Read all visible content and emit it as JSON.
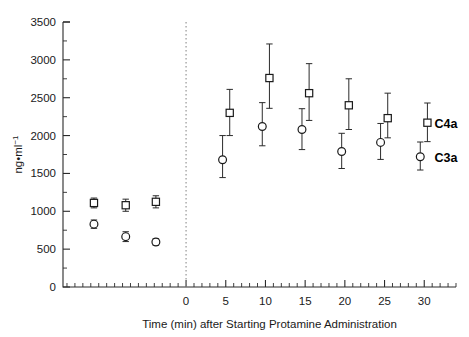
{
  "chart_data": {
    "type": "scatter",
    "title": "",
    "xlabel": "Time (min) after Starting Protamine Administration",
    "ylabel": "ng•ml⁻¹",
    "ylim": [
      0,
      3500
    ],
    "ytick_values": [
      0,
      500,
      1000,
      1500,
      2000,
      2500,
      3000,
      3500
    ],
    "ytick_labels": [
      "0",
      "500",
      "1000",
      "1500",
      "2000",
      "2500",
      "3000",
      "3500"
    ],
    "xlim": [
      -15.5,
      34
    ],
    "xtick_values": [
      0,
      5,
      10,
      15,
      20,
      25,
      30
    ],
    "xtick_labels": [
      "0",
      "5",
      "10",
      "15",
      "20",
      "25",
      "30"
    ],
    "x_minor_step": 1,
    "grid": false,
    "legend_position": "right-inline",
    "annotations": [
      {
        "text": "C4a",
        "x": 31.3,
        "y": 2170,
        "bold": true
      },
      {
        "text": "C3a",
        "x": 31.3,
        "y": 1720,
        "bold": true
      }
    ],
    "reference_lines": [
      {
        "orientation": "vertical",
        "x": 0,
        "style": "dotted",
        "color": "#8d8d8d"
      }
    ],
    "series": [
      {
        "name": "C4a",
        "marker": "open-square",
        "color": "#1a1a1a",
        "points": [
          {
            "x": -11.6,
            "y": 1110,
            "err_low": 65,
            "err_high": 65
          },
          {
            "x": -7.6,
            "y": 1080,
            "err_low": 80,
            "err_high": 80
          },
          {
            "x": -3.8,
            "y": 1125,
            "err_low": 80,
            "err_high": 80
          },
          {
            "x": 5.5,
            "y": 2300,
            "err_low": 300,
            "err_high": 310
          },
          {
            "x": 10.5,
            "y": 2760,
            "err_low": 400,
            "err_high": 450
          },
          {
            "x": 15.5,
            "y": 2560,
            "err_low": 360,
            "err_high": 390
          },
          {
            "x": 20.5,
            "y": 2400,
            "err_low": 320,
            "err_high": 350
          },
          {
            "x": 25.4,
            "y": 2230,
            "err_low": 260,
            "err_high": 330
          },
          {
            "x": 30.4,
            "y": 2170,
            "err_low": 250,
            "err_high": 260
          }
        ]
      },
      {
        "name": "C3a",
        "marker": "open-circle",
        "color": "#1a1a1a",
        "points": [
          {
            "x": -11.6,
            "y": 830,
            "err_low": 55,
            "err_high": 55
          },
          {
            "x": -7.6,
            "y": 665,
            "err_low": 65,
            "err_high": 65
          },
          {
            "x": -3.8,
            "y": 595,
            "err_low": 45,
            "err_high": 45
          },
          {
            "x": 4.6,
            "y": 1680,
            "err_low": 235,
            "err_high": 320
          },
          {
            "x": 9.6,
            "y": 2120,
            "err_low": 255,
            "err_high": 315
          },
          {
            "x": 14.6,
            "y": 2080,
            "err_low": 265,
            "err_high": 275
          },
          {
            "x": 19.6,
            "y": 1790,
            "err_low": 225,
            "err_high": 240
          },
          {
            "x": 24.5,
            "y": 1910,
            "err_low": 225,
            "err_high": 250
          },
          {
            "x": 29.5,
            "y": 1720,
            "err_low": 175,
            "err_high": 195
          }
        ]
      }
    ]
  }
}
